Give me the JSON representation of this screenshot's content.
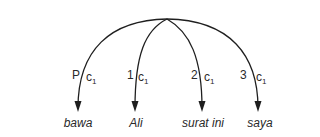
{
  "diagram": {
    "type": "dependency-arc-diagram",
    "root_position": [
      167,
      19
    ],
    "stroke_color": "#1f1f1f",
    "arcs": [
      {
        "relation": "P",
        "relation_sub": "c",
        "relation_index": "1",
        "target": "bawa"
      },
      {
        "relation": "1",
        "relation_sub": "c",
        "relation_index": "1",
        "target": "Ali"
      },
      {
        "relation": "2",
        "relation_sub": "c",
        "relation_index": "1",
        "target": "surat ini"
      },
      {
        "relation": "3",
        "relation_sub": "c",
        "relation_index": "1",
        "target": "saya"
      }
    ]
  }
}
